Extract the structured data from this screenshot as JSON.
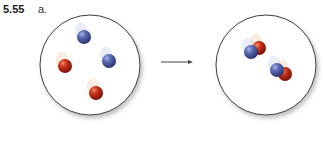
{
  "figure": {
    "problem_number": "5.55",
    "part_label": "a."
  },
  "diagram": {
    "left_container": {
      "cx": 90,
      "cy": 65,
      "r": 50,
      "particles": [
        {
          "type": "blue-atom",
          "cx": 84,
          "cy": 37,
          "r": 7
        },
        {
          "type": "red-atom",
          "cx": 65,
          "cy": 66,
          "r": 7
        },
        {
          "type": "blue-atom",
          "cx": 109,
          "cy": 61,
          "r": 7
        },
        {
          "type": "red-atom",
          "cx": 96,
          "cy": 93,
          "r": 7
        }
      ]
    },
    "arrow": {
      "x1": 161,
      "y1": 62,
      "x2": 193,
      "y2": 62
    },
    "right_container": {
      "cx": 266,
      "cy": 65,
      "r": 50,
      "molecules": [
        {
          "atoms": [
            {
              "type": "red-atom",
              "cx": 259,
              "cy": 48,
              "r": 7
            },
            {
              "type": "blue-atom",
              "cx": 251,
              "cy": 52,
              "r": 7
            }
          ]
        },
        {
          "atoms": [
            {
              "type": "red-atom",
              "cx": 285,
              "cy": 74,
              "r": 7
            },
            {
              "type": "blue-atom",
              "cx": 277,
              "cy": 70,
              "r": 7
            }
          ]
        }
      ]
    },
    "colors": {
      "blue": "#4f5fa8",
      "red": "#c12a16",
      "outline": "#3a3a3a"
    }
  }
}
